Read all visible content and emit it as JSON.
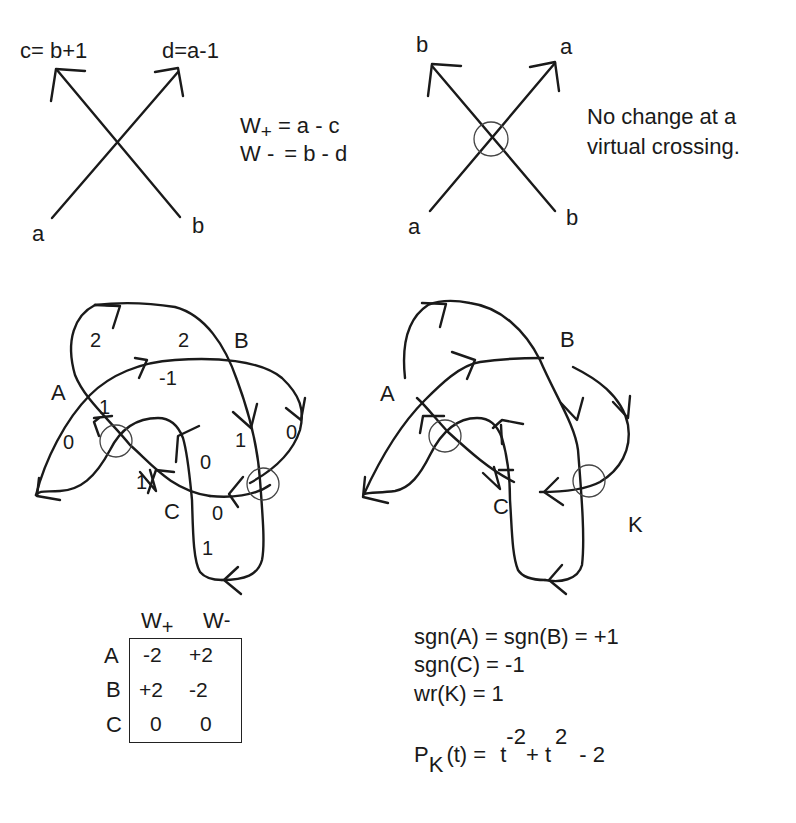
{
  "top_left": {
    "label_c": "c= b+1",
    "label_d": "d=a-1",
    "label_a": "a",
    "label_b": "b",
    "formula_wplus": "W+ = a - c",
    "formula_wplus_main": "W",
    "formula_wplus_sub": "+",
    "formula_wplus_rhs": "= a - c",
    "formula_wminus_main": "W -",
    "formula_wminus_rhs": "= b - d"
  },
  "top_right": {
    "label_top_left": "b",
    "label_top_right": "a",
    "label_bottom_left": "a",
    "label_bottom_right": "b",
    "note_line1": "No change at a",
    "note_line2": "virtual crossing."
  },
  "left_knot": {
    "crossing_labels": {
      "A": "A",
      "B": "B",
      "C": "C"
    },
    "arc_weights": [
      "2",
      "2",
      "-1",
      "1",
      "0",
      "1",
      "0",
      "1",
      "0",
      "0",
      "1"
    ]
  },
  "right_knot": {
    "crossing_labels": {
      "A": "A",
      "B": "B",
      "C": "C"
    },
    "knot_name": "K"
  },
  "weight_table": {
    "headers": [
      "W+",
      "W-"
    ],
    "header_main": [
      "W",
      "W"
    ],
    "header_sub": [
      "+",
      "-"
    ],
    "rows": [
      {
        "label": "A",
        "wplus": "-2",
        "wminus": "+2"
      },
      {
        "label": "B",
        "wplus": "+2",
        "wminus": "-2"
      },
      {
        "label": "C",
        "wplus": "0",
        "wminus": "0"
      }
    ]
  },
  "equations": {
    "line1": "sgn(A) = sgn(B) = +1",
    "line2": "sgn(C) = -1",
    "line3": "wr(K) = 1",
    "poly_lhs_P": "P",
    "poly_lhs_sub": "K",
    "poly_lhs_rest": "(t) =",
    "poly_t1": "t",
    "poly_exp1": "-2",
    "poly_plus": "+ t",
    "poly_exp2": "2",
    "poly_tail": "- 2"
  }
}
